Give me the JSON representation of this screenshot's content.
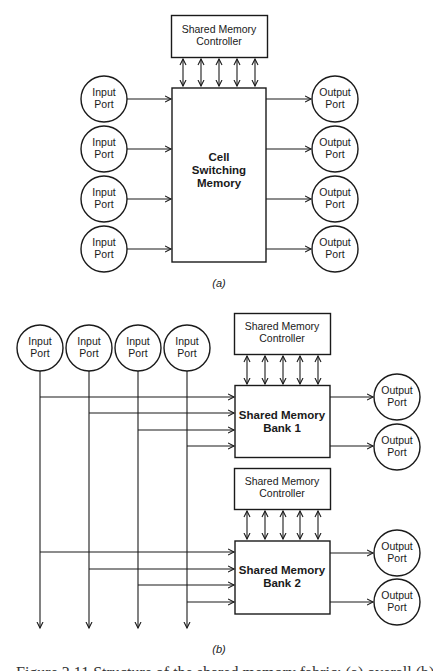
{
  "figure": {
    "part_a": {
      "label": "(a)",
      "controller": {
        "line1": "Shared Memory",
        "line2": "Controller"
      },
      "memory": {
        "line1": "Cell",
        "line2": "Switching",
        "line3": "Memory"
      },
      "inputs": [
        {
          "line1": "Input",
          "line2": "Port"
        },
        {
          "line1": "Input",
          "line2": "Port"
        },
        {
          "line1": "Input",
          "line2": "Port"
        },
        {
          "line1": "Input",
          "line2": "Port"
        }
      ],
      "outputs": [
        {
          "line1": "Output",
          "line2": "Port"
        },
        {
          "line1": "Output",
          "line2": "Port"
        },
        {
          "line1": "Output",
          "line2": "Port"
        },
        {
          "line1": "Output",
          "line2": "Port"
        }
      ],
      "controller_bus_lines": 5
    },
    "part_b": {
      "label": "(b)",
      "inputs": [
        {
          "line1": "Input",
          "line2": "Port"
        },
        {
          "line1": "Input",
          "line2": "Port"
        },
        {
          "line1": "Input",
          "line2": "Port"
        },
        {
          "line1": "Input",
          "line2": "Port"
        }
      ],
      "banks": [
        {
          "controller": {
            "line1": "Shared Memory",
            "line2": "Controller"
          },
          "memory": {
            "line1": "Shared Memory",
            "line2": "Bank 1"
          },
          "outputs": [
            {
              "line1": "Output",
              "line2": "Port"
            },
            {
              "line1": "Output",
              "line2": "Port"
            }
          ]
        },
        {
          "controller": {
            "line1": "Shared Memory",
            "line2": "Controller"
          },
          "memory": {
            "line1": "Shared Memory",
            "line2": "Bank 2"
          },
          "outputs": [
            {
              "line1": "Output",
              "line2": "Port"
            },
            {
              "line1": "Output",
              "line2": "Port"
            }
          ]
        }
      ],
      "controller_bus_lines": 5
    },
    "caption_partial": "Figure 3.11  Structure of the shared memory fabric: (a) overall (b)"
  },
  "colors": {
    "stroke": "#1a1a1a",
    "background": "#ffffff"
  }
}
